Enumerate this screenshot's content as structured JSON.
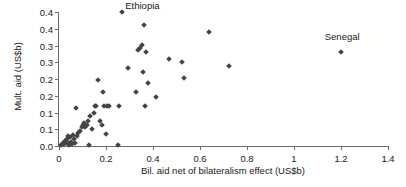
{
  "chart_data": {
    "type": "scatter",
    "title": "",
    "xlabel": "Bil. aid net of bilateralism effect (US$b)",
    "ylabel": "Mult. aid (US$b)",
    "xlim": [
      0,
      1.4
    ],
    "ylim": [
      0,
      0.4
    ],
    "grid": false,
    "legend": null,
    "xticks": [
      0,
      0.2,
      0.4,
      0.6,
      0.8,
      1,
      1.2,
      1.4
    ],
    "xtick_labels": [
      "0",
      "0.2",
      "0.4",
      "0.6",
      "0.8",
      "1",
      "1.2",
      "1.4"
    ],
    "yticks": [
      0.4,
      0.35,
      0.3,
      0.25,
      0.2,
      0.15,
      0.1,
      0.05,
      0
    ],
    "ytick_labels": [
      "0.4",
      "0.4",
      "0.3",
      "0.3",
      "0.2",
      "0.2",
      "0.1",
      "0.1",
      "0.0"
    ],
    "marker": "diamond",
    "marker_color": "#444444",
    "axis_color": "#6b6b6b",
    "series": [
      {
        "name": "countries",
        "points": [
          [
            0.01,
            0.004
          ],
          [
            0.016,
            0.01
          ],
          [
            0.02,
            0.006
          ],
          [
            0.024,
            0.016
          ],
          [
            0.028,
            0.008
          ],
          [
            0.033,
            0.022
          ],
          [
            0.036,
            0.012
          ],
          [
            0.04,
            0.03
          ],
          [
            0.044,
            0.004
          ],
          [
            0.048,
            0.026
          ],
          [
            0.052,
            0.012
          ],
          [
            0.056,
            0.006
          ],
          [
            0.06,
            0.034
          ],
          [
            0.064,
            0.02
          ],
          [
            0.068,
            0.008
          ],
          [
            0.072,
            0.114
          ],
          [
            0.075,
            0.03
          ],
          [
            0.082,
            0.04
          ],
          [
            0.09,
            0.046
          ],
          [
            0.098,
            0.058
          ],
          [
            0.104,
            0.064
          ],
          [
            0.108,
            0.07
          ],
          [
            0.112,
            0.056
          ],
          [
            0.118,
            0.062
          ],
          [
            0.124,
            0.076
          ],
          [
            0.128,
            0.002
          ],
          [
            0.132,
            0.09
          ],
          [
            0.14,
            0.052
          ],
          [
            0.148,
            0.098
          ],
          [
            0.152,
            0.12
          ],
          [
            0.158,
            0.12
          ],
          [
            0.168,
            0.196
          ],
          [
            0.176,
            0.074
          ],
          [
            0.182,
            0.062
          ],
          [
            0.186,
            0.16
          ],
          [
            0.192,
            0.118
          ],
          [
            0.198,
            0.036
          ],
          [
            0.206,
            0.118
          ],
          [
            0.214,
            0.12
          ],
          [
            0.252,
            0.002
          ],
          [
            0.256,
            0.12
          ],
          [
            0.268,
            0.4
          ],
          [
            0.292,
            0.234
          ],
          [
            0.326,
            0.162
          ],
          [
            0.336,
            0.286
          ],
          [
            0.344,
            0.292
          ],
          [
            0.352,
            0.302
          ],
          [
            0.356,
            0.22
          ],
          [
            0.362,
            0.362
          ],
          [
            0.366,
            0.118
          ],
          [
            0.372,
            0.282
          ],
          [
            0.38,
            0.188
          ],
          [
            0.412,
            0.146
          ],
          [
            0.468,
            0.26
          ],
          [
            0.524,
            0.252
          ],
          [
            0.532,
            0.204
          ],
          [
            0.64,
            0.34
          ],
          [
            0.722,
            0.238
          ],
          [
            1.202,
            0.282
          ]
        ]
      }
    ],
    "annotations": [
      {
        "text": "Ethiopia",
        "x": 0.355,
        "y": 0.42
      },
      {
        "text": "Senegal",
        "x": 1.205,
        "y": 0.328
      }
    ]
  }
}
